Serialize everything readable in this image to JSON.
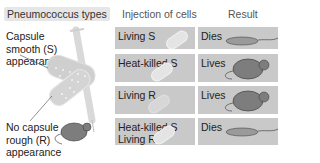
{
  "headers": {
    "types": "Pneumococcus types",
    "injection": "Injection of cells",
    "result": "Result"
  },
  "labels": {
    "smooth": [
      "Capsule",
      "smooth (S)",
      "appearance"
    ],
    "rough": [
      "No capsule",
      "rough (R)",
      "appearance"
    ]
  },
  "rows": [
    {
      "injection": "Living S",
      "result": "Dies",
      "mouse": "dead"
    },
    {
      "injection": "Heat-killed S",
      "result": "Lives",
      "mouse": "alive"
    },
    {
      "injection": "Living R",
      "result": "Lives",
      "mouse": "alive"
    },
    {
      "injection": "Heat-killed S\nLiving R",
      "result": "Dies",
      "mouse": "dead"
    }
  ],
  "colors": {
    "cell_bg": "#c9c9c9",
    "mouse_alive": "#7d7d7d",
    "mouse_dead": "#9a9a9a",
    "syringe": "#d0d0d0"
  },
  "icons": [
    "syringe-icon",
    "bacterium-icon",
    "mouse-icon"
  ]
}
